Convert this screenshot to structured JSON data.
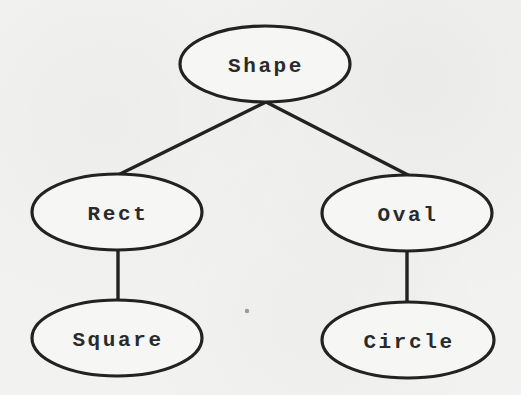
{
  "diagram": {
    "type": "class-hierarchy-tree",
    "colors": {
      "background": "#f2f2f1",
      "stroke": "#222222",
      "text": "#2a2a2a"
    },
    "nodes": [
      {
        "id": "shape",
        "label": "Shape",
        "cx": 265,
        "cy": 64,
        "rx": 85,
        "ry": 38
      },
      {
        "id": "rect",
        "label": "Rect",
        "cx": 117,
        "cy": 212,
        "rx": 85,
        "ry": 38
      },
      {
        "id": "oval",
        "label": "Oval",
        "cx": 407,
        "cy": 213,
        "rx": 85,
        "ry": 38
      },
      {
        "id": "square",
        "label": "Square",
        "cx": 117,
        "cy": 338,
        "rx": 85,
        "ry": 38
      },
      {
        "id": "circle",
        "label": "Circle",
        "cx": 408,
        "cy": 340,
        "rx": 86,
        "ry": 38
      }
    ],
    "edges": [
      {
        "from": "Shape",
        "to": "Rect"
      },
      {
        "from": "Shape",
        "to": "Oval"
      },
      {
        "from": "Rect",
        "to": "Square"
      },
      {
        "from": "Oval",
        "to": "Circle"
      }
    ]
  }
}
